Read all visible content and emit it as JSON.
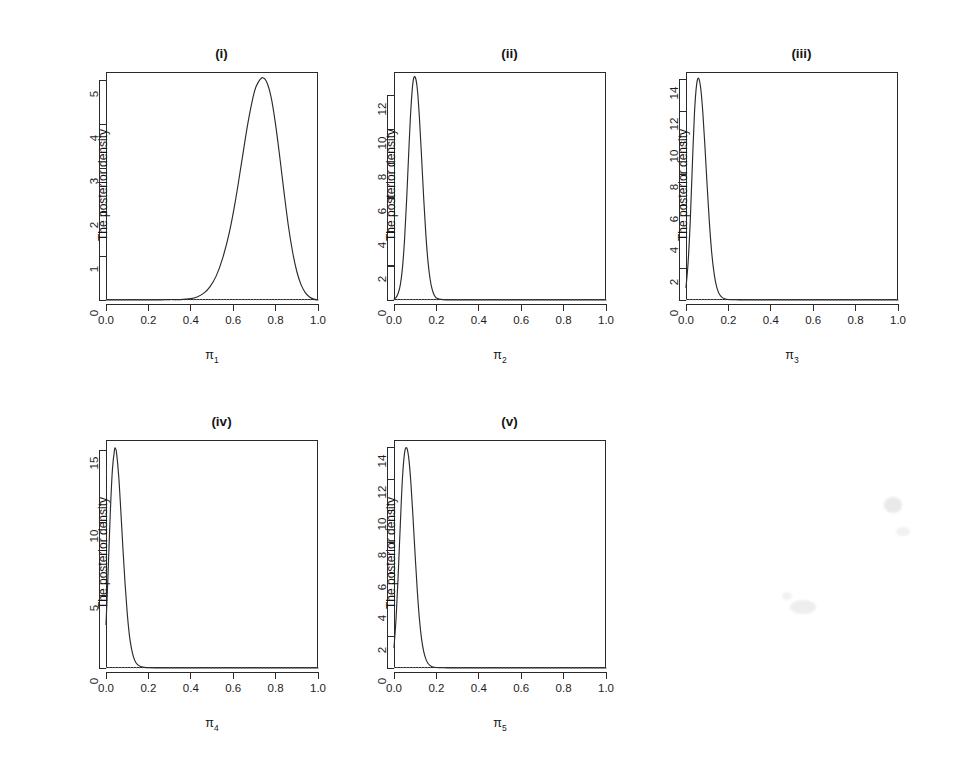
{
  "figure": {
    "ylabel": "The posterior density",
    "xtick_labels": [
      "0.0",
      "0.2",
      "0.4",
      "0.6",
      "0.8",
      "1.0"
    ],
    "xticks": [
      0.0,
      0.2,
      0.4,
      0.6,
      0.8,
      1.0
    ],
    "xlim": [
      0.0,
      1.0
    ],
    "curve_color": "#2b2b2b",
    "baseline_color": "#bdbdbd",
    "frame_color": "#2b2b2b",
    "background": "#ffffff"
  },
  "chart_data": [
    {
      "type": "line",
      "title": "(i)",
      "xlabel": "π",
      "xlabel_sub": "1",
      "ylabel": "The posterior density",
      "xlim": [
        0.0,
        1.0
      ],
      "ylim": [
        0,
        5.2
      ],
      "xticks": [
        0.0,
        0.2,
        0.4,
        0.6,
        0.8,
        1.0
      ],
      "xtick_labels": [
        "0.0",
        "0.2",
        "0.4",
        "0.6",
        "0.8",
        "1.0"
      ],
      "yticks": [
        0,
        1,
        2,
        3,
        4,
        5
      ],
      "ytick_labels": [
        "0",
        "1",
        "2",
        "3",
        "4",
        "5"
      ],
      "grid": false,
      "legend": "none",
      "peak_x": 0.74,
      "peak_y": 5.07,
      "mode_note": "unimodal posterior density centered near 0.74",
      "x": [
        0.0,
        0.05,
        0.1,
        0.15,
        0.2,
        0.25,
        0.3,
        0.35,
        0.4,
        0.43,
        0.46,
        0.49,
        0.52,
        0.55,
        0.58,
        0.61,
        0.64,
        0.67,
        0.7,
        0.72,
        0.74,
        0.76,
        0.78,
        0.8,
        0.82,
        0.84,
        0.86,
        0.88,
        0.9,
        0.92,
        0.94,
        0.96,
        0.98,
        1.0
      ],
      "y": [
        0.0,
        0.0,
        0.0,
        0.0,
        0.0,
        0.0,
        0.01,
        0.01,
        0.03,
        0.07,
        0.15,
        0.3,
        0.55,
        0.95,
        1.5,
        2.25,
        3.15,
        4.05,
        4.75,
        4.98,
        5.07,
        4.95,
        4.6,
        4.0,
        3.25,
        2.45,
        1.7,
        1.1,
        0.65,
        0.35,
        0.17,
        0.07,
        0.02,
        0.0
      ]
    },
    {
      "type": "line",
      "title": "(ii)",
      "xlabel": "π",
      "xlabel_sub": "2",
      "ylabel": "The posterior density",
      "xlim": [
        0.0,
        1.0
      ],
      "ylim": [
        0,
        13.4
      ],
      "xticks": [
        0.0,
        0.2,
        0.4,
        0.6,
        0.8,
        1.0
      ],
      "xtick_labels": [
        "0.0",
        "0.2",
        "0.4",
        "0.6",
        "0.8",
        "1.0"
      ],
      "yticks": [
        0,
        2,
        4,
        6,
        8,
        10,
        12
      ],
      "ytick_labels": [
        "0",
        "2",
        "4",
        "6",
        "8",
        "10",
        "12"
      ],
      "grid": false,
      "legend": "none",
      "peak_x": 0.1,
      "peak_y": 13.1,
      "mode_note": "sharp unimodal posterior density centered near 0.10",
      "x": [
        0.0,
        0.01,
        0.02,
        0.03,
        0.04,
        0.05,
        0.06,
        0.07,
        0.08,
        0.09,
        0.1,
        0.11,
        0.12,
        0.13,
        0.14,
        0.15,
        0.16,
        0.17,
        0.18,
        0.19,
        0.2,
        0.22,
        0.25,
        0.3,
        0.4,
        0.6,
        0.8,
        1.0
      ],
      "y": [
        0.05,
        0.15,
        0.4,
        0.9,
        1.9,
        3.6,
        6.0,
        8.8,
        11.3,
        12.85,
        13.1,
        12.4,
        10.7,
        8.4,
        6.0,
        3.9,
        2.3,
        1.25,
        0.62,
        0.28,
        0.12,
        0.04,
        0.01,
        0.0,
        0.0,
        0.0,
        0.0,
        0.0
      ]
    },
    {
      "type": "line",
      "title": "(iii)",
      "xlabel": "π",
      "xlabel_sub": "3",
      "ylabel": "The posterior density",
      "xlim": [
        0.0,
        1.0
      ],
      "ylim": [
        0,
        14.5
      ],
      "xticks": [
        0.0,
        0.2,
        0.4,
        0.6,
        0.8,
        1.0
      ],
      "xtick_labels": [
        "0.0",
        "0.2",
        "0.4",
        "0.6",
        "0.8",
        "1.0"
      ],
      "yticks": [
        0,
        2,
        4,
        6,
        8,
        10,
        12,
        14
      ],
      "ytick_labels": [
        "0",
        "2",
        "4",
        "6",
        "8",
        "10",
        "12",
        "14"
      ],
      "grid": false,
      "legend": "none",
      "peak_x": 0.06,
      "peak_y": 14.1,
      "mode_note": "sharp unimodal posterior density centered near 0.06, nonzero at x=0",
      "x": [
        0.0,
        0.01,
        0.02,
        0.03,
        0.04,
        0.05,
        0.06,
        0.07,
        0.08,
        0.09,
        0.1,
        0.11,
        0.12,
        0.13,
        0.14,
        0.15,
        0.16,
        0.17,
        0.18,
        0.2,
        0.25,
        0.3,
        0.4,
        0.6,
        0.8,
        1.0
      ],
      "y": [
        0.8,
        2.4,
        5.0,
        8.6,
        11.9,
        13.7,
        14.1,
        13.4,
        11.8,
        9.6,
        7.2,
        5.0,
        3.2,
        1.95,
        1.1,
        0.6,
        0.32,
        0.17,
        0.09,
        0.03,
        0.01,
        0.0,
        0.0,
        0.0,
        0.0,
        0.0
      ]
    },
    {
      "type": "line",
      "title": "(iv)",
      "xlabel": "π",
      "xlabel_sub": "4",
      "ylabel": "The posterior density",
      "xlim": [
        0.0,
        1.0
      ],
      "ylim": [
        0,
        15.7
      ],
      "xticks": [
        0.0,
        0.2,
        0.4,
        0.6,
        0.8,
        1.0
      ],
      "xtick_labels": [
        "0.0",
        "0.2",
        "0.4",
        "0.6",
        "0.8",
        "1.0"
      ],
      "yticks": [
        0,
        5,
        10,
        15
      ],
      "ytick_labels": [
        "0",
        "5",
        "10",
        "15"
      ],
      "grid": false,
      "legend": "none",
      "peak_x": 0.045,
      "peak_y": 15.1,
      "mode_note": "sharp unimodal posterior density centered near 0.045, starts near 3 at x=0",
      "x": [
        0.0,
        0.01,
        0.02,
        0.03,
        0.04,
        0.045,
        0.05,
        0.06,
        0.07,
        0.08,
        0.09,
        0.1,
        0.11,
        0.12,
        0.13,
        0.14,
        0.15,
        0.16,
        0.18,
        0.2,
        0.25,
        0.3,
        0.4,
        0.6,
        0.8,
        1.0
      ],
      "y": [
        3.0,
        6.6,
        10.6,
        13.6,
        15.0,
        15.1,
        14.8,
        13.2,
        10.8,
        8.2,
        5.8,
        3.8,
        2.3,
        1.35,
        0.75,
        0.4,
        0.22,
        0.12,
        0.05,
        0.02,
        0.01,
        0.0,
        0.0,
        0.0,
        0.0,
        0.0
      ]
    },
    {
      "type": "line",
      "title": "(v)",
      "xlabel": "π",
      "xlabel_sub": "5",
      "ylabel": "The posterior density",
      "xlim": [
        0.0,
        1.0
      ],
      "ylim": [
        0,
        14.5
      ],
      "xticks": [
        0.0,
        0.2,
        0.4,
        0.6,
        0.8,
        1.0
      ],
      "xtick_labels": [
        "0.0",
        "0.2",
        "0.4",
        "0.6",
        "0.8",
        "1.0"
      ],
      "yticks": [
        0,
        2,
        4,
        6,
        8,
        10,
        12,
        14
      ],
      "ytick_labels": [
        "0",
        "2",
        "4",
        "6",
        "8",
        "10",
        "12",
        "14"
      ],
      "grid": false,
      "legend": "none",
      "peak_x": 0.06,
      "peak_y": 14.0,
      "mode_note": "sharp unimodal posterior density centered near 0.06, starts near 1.3 at x=0",
      "x": [
        0.0,
        0.01,
        0.02,
        0.03,
        0.04,
        0.05,
        0.06,
        0.07,
        0.08,
        0.09,
        0.1,
        0.11,
        0.12,
        0.13,
        0.14,
        0.15,
        0.16,
        0.17,
        0.18,
        0.2,
        0.25,
        0.3,
        0.4,
        0.6,
        0.8,
        1.0
      ],
      "y": [
        1.3,
        3.2,
        6.0,
        9.2,
        12.1,
        13.7,
        14.0,
        13.3,
        11.7,
        9.5,
        7.1,
        4.9,
        3.1,
        1.85,
        1.05,
        0.58,
        0.3,
        0.16,
        0.08,
        0.03,
        0.01,
        0.0,
        0.0,
        0.0,
        0.0,
        0.0
      ]
    }
  ],
  "panel_positions": [
    {
      "left": 60,
      "top": 20
    },
    {
      "left": 348,
      "top": 20
    },
    {
      "left": 640,
      "top": 20
    },
    {
      "left": 60,
      "top": 388
    },
    {
      "left": 348,
      "top": 388
    }
  ]
}
